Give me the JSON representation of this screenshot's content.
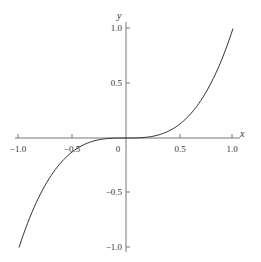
{
  "chart_data": {
    "type": "line",
    "title": "",
    "function": "y = x^3",
    "xlabel": "x",
    "ylabel": "y",
    "xlim": [
      -1.0,
      1.0
    ],
    "ylim": [
      -1.0,
      1.0
    ],
    "x_ticks": [
      "-1.0",
      "-0.5",
      "0",
      "0.5",
      "1.0"
    ],
    "y_ticks": [
      "1.0",
      "0.5",
      "-0.5",
      "-1.0"
    ],
    "grid": false,
    "series": [
      {
        "name": "y = x^3",
        "x": [
          -1.0,
          -0.9,
          -0.8,
          -0.7,
          -0.6,
          -0.5,
          -0.4,
          -0.3,
          -0.2,
          -0.1,
          0.0,
          0.1,
          0.2,
          0.3,
          0.4,
          0.5,
          0.6,
          0.7,
          0.8,
          0.9,
          1.0
        ],
        "values": [
          -1.0,
          -0.729,
          -0.512,
          -0.343,
          -0.216,
          -0.125,
          -0.064,
          -0.027,
          -0.008,
          -0.001,
          0.0,
          0.001,
          0.008,
          0.027,
          0.064,
          0.125,
          0.216,
          0.343,
          0.512,
          0.729,
          1.0
        ]
      }
    ]
  },
  "labels": {
    "x_axis": "x",
    "y_axis": "y",
    "x_tick_neg1": "−1.0",
    "x_tick_neg05": "−0.5",
    "x_tick_0": "0",
    "x_tick_05": "0.5",
    "x_tick_1": "1.0",
    "y_tick_1": "1.0",
    "y_tick_05": "0.5",
    "y_tick_neg05": "−0.5",
    "y_tick_neg1": "−1.0"
  }
}
